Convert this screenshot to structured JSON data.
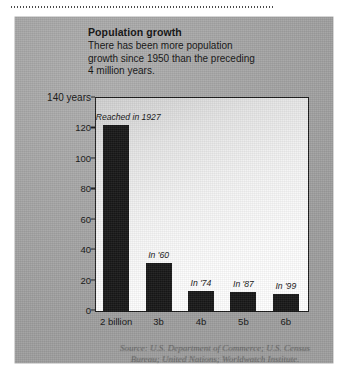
{
  "panel": {
    "headline": "Population growth",
    "blurb_lines": [
      "There has been more population",
      "growth since 1950 than the preceding",
      "4 million years."
    ],
    "source_lines": [
      "Source: U.S. Department of Commerce; U.S. Census",
      "Bureau; United Nations; Worldwatch Institute."
    ]
  },
  "chart_data": {
    "type": "bar",
    "title": "Population growth",
    "subtitle": "There has been more population growth since 1950 than the preceding 4 million years.",
    "xlabel": "",
    "ylabel": "years",
    "categories": [
      "2 billion",
      "3b",
      "4b",
      "5b",
      "6b"
    ],
    "values": [
      123,
      32,
      14,
      13,
      12
    ],
    "annotations": [
      "Reached in 1927",
      "In '60",
      "In '74",
      "In '87",
      "In '99"
    ],
    "ylim": [
      0,
      140
    ],
    "yticks": [
      0,
      20,
      40,
      60,
      80,
      100,
      120
    ],
    "ytick_labels": [
      "0",
      "20",
      "40",
      "60",
      "80",
      "100",
      "120"
    ],
    "y_top_label": "140 years",
    "grid": false,
    "legend": "none",
    "bar_color": "#171717",
    "source": "Source: U.S. Department of Commerce; U.S. Census Bureau; United Nations; Worldwatch Institute."
  }
}
